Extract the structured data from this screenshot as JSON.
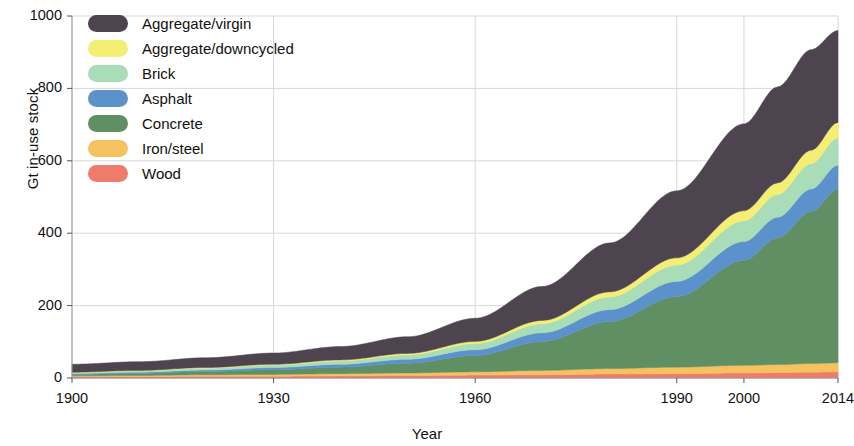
{
  "chart_data": {
    "type": "area",
    "stacked": true,
    "title": "",
    "xlabel": "Year",
    "ylabel": "Gt in-use stock",
    "xlim": [
      1900,
      2014
    ],
    "ylim": [
      0,
      1000
    ],
    "xticks": [
      1900,
      1930,
      1960,
      1990,
      2000,
      2014
    ],
    "xtick_labels": [
      "1900",
      "1930",
      "1960",
      "1990",
      "2000",
      "2014"
    ],
    "yticks": [
      0,
      200,
      400,
      600,
      800,
      1000
    ],
    "ytick_labels": [
      "0",
      "200",
      "400",
      "600",
      "800",
      "1000"
    ],
    "grid": true,
    "legend_position": "upper-left",
    "x": [
      1900,
      1910,
      1920,
      1930,
      1940,
      1950,
      1960,
      1970,
      1980,
      1990,
      2000,
      2005,
      2010,
      2014
    ],
    "series": [
      {
        "name": "Wood",
        "color": "#ef7b6b",
        "values": [
          4,
          4,
          5,
          5,
          6,
          7,
          8,
          9,
          11,
          12,
          14,
          15,
          16,
          17
        ]
      },
      {
        "name": "Iron/steel",
        "color": "#f6c25f",
        "values": [
          2,
          3,
          4,
          5,
          6,
          7,
          9,
          12,
          15,
          18,
          21,
          22,
          24,
          25
        ]
      },
      {
        "name": "Concrete",
        "color": "#5f8f63",
        "values": [
          4,
          6,
          9,
          13,
          18,
          27,
          45,
          80,
          130,
          195,
          290,
          350,
          420,
          480
        ]
      },
      {
        "name": "Asphalt",
        "color": "#5b92cc",
        "values": [
          2,
          3,
          4,
          6,
          8,
          11,
          16,
          24,
          33,
          42,
          52,
          57,
          62,
          66
        ]
      },
      {
        "name": "Brick",
        "color": "#a8ddb8",
        "values": [
          3,
          4,
          5,
          7,
          9,
          12,
          17,
          25,
          35,
          45,
          57,
          63,
          70,
          76
        ]
      },
      {
        "name": "Aggregate/downcycled",
        "color": "#f4ef72",
        "values": [
          1,
          1,
          2,
          2,
          3,
          4,
          6,
          9,
          14,
          20,
          28,
          32,
          37,
          42
        ]
      },
      {
        "name": "Aggregate/virgin",
        "color": "#4e4450",
        "values": [
          22,
          24,
          27,
          31,
          37,
          46,
          64,
          94,
          135,
          185,
          240,
          265,
          278,
          254
        ]
      }
    ],
    "totals": [
      38,
      45,
      56,
      69,
      87,
      114,
      165,
      253,
      373,
      517,
      702,
      804,
      907,
      960
    ]
  },
  "legend": {
    "items": [
      {
        "label": "Aggregate/virgin",
        "color": "#4e4450"
      },
      {
        "label": "Aggregate/downcycled",
        "color": "#f4ef72"
      },
      {
        "label": "Brick",
        "color": "#a8ddb8"
      },
      {
        "label": "Asphalt",
        "color": "#5b92cc"
      },
      {
        "label": "Concrete",
        "color": "#5f8f63"
      },
      {
        "label": "Iron/steel",
        "color": "#f6c25f"
      },
      {
        "label": "Wood",
        "color": "#ef7b6b"
      }
    ]
  },
  "axes": {
    "x_title": "Year",
    "y_title": "Gt in-use stock"
  }
}
